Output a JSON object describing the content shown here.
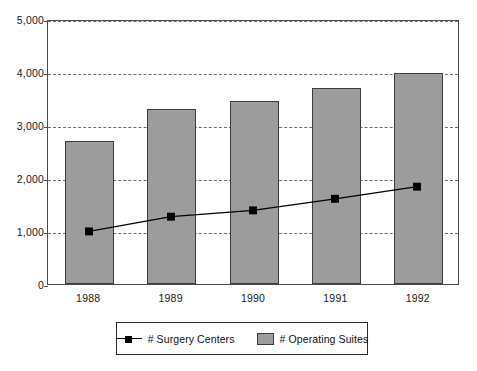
{
  "chart_data": {
    "type": "bar",
    "title": "",
    "subtitle": "",
    "xlabel": "",
    "ylabel": "",
    "categories": [
      "1988",
      "1989",
      "1990",
      "1991",
      "1992"
    ],
    "ylim": [
      0,
      5000
    ],
    "ytick_labels": [
      "0",
      "1,000",
      "2,000",
      "3,000",
      "4,000",
      "5,000"
    ],
    "ytick_values": [
      0,
      1000,
      2000,
      3000,
      4000,
      5000
    ],
    "grid": "horizontal-dashed",
    "legend_position": "bottom",
    "series": [
      {
        "name": "# Surgery Centers",
        "type": "line",
        "marker": "square",
        "color": "#000000",
        "values": [
          1000,
          1280,
          1400,
          1620,
          1850
        ]
      },
      {
        "name": "# Operating Suites",
        "type": "bar",
        "color": "#9c9c9c",
        "values": [
          2700,
          3300,
          3450,
          3700,
          3980
        ]
      }
    ]
  },
  "legend": {
    "entries": [
      {
        "label": "# Surgery Centers",
        "key": "line-marker-key"
      },
      {
        "label": "# Operating Suites",
        "key": "gray-swatch-key"
      }
    ]
  },
  "colors": {
    "bar_fill": "#9c9c9c",
    "bar_border": "#3d3d3d",
    "line": "#000000",
    "gridline": "#6e6e6e",
    "axis": "#4c4c4c",
    "background": "#ffffff",
    "text": "#1a1a1a"
  }
}
